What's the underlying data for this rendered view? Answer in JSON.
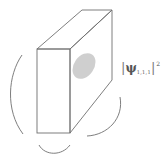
{
  "diagram": {
    "type": "3d-box-wavefunction",
    "label": {
      "bar_left": "|",
      "symbol": "ψ",
      "subscript": "1,1,1",
      "bar_right": "|",
      "superscript": "2"
    },
    "colors": {
      "stroke": "#6f6f6f",
      "blob": "#cfcfcf",
      "background": "#ffffff"
    }
  }
}
